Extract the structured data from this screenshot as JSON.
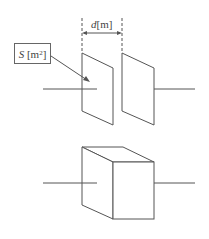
{
  "diagram": {
    "type": "capacitor-illustration",
    "top": {
      "description": "Parallel plate capacitor",
      "distance_label": {
        "symbol": "d",
        "unit": "[m]"
      },
      "area_label": {
        "symbol": "S",
        "unit_base": "[m",
        "unit_exp": "2",
        "unit_close": "]"
      }
    },
    "bottom": {
      "description": "Dielectric block between plates (cube)"
    },
    "colors": {
      "stroke": "#555555",
      "text": "#444444",
      "background": "#ffffff"
    }
  }
}
